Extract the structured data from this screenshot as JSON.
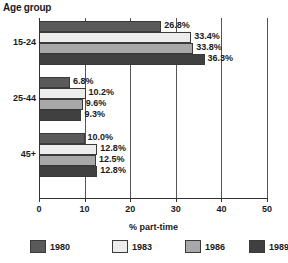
{
  "chart_data": {
    "type": "bar",
    "orientation": "horizontal",
    "title": "Age group",
    "xlabel": "% part-time",
    "ylabel": "Age group",
    "categories": [
      "15-24",
      "25-44",
      "45+"
    ],
    "series": [
      {
        "name": "1980",
        "color": "#5a5a5a",
        "values": [
          26.8,
          6.8,
          10.0
        ]
      },
      {
        "name": "1983",
        "color": "#ececec",
        "values": [
          33.4,
          10.2,
          12.8
        ]
      },
      {
        "name": "1986",
        "color": "#a8a8a8",
        "values": [
          33.8,
          9.6,
          12.5
        ]
      },
      {
        "name": "1989",
        "color": "#404040",
        "values": [
          36.3,
          9.3,
          12.8
        ]
      }
    ],
    "value_labels": [
      [
        "26.8%",
        "33.4%",
        "33.8%",
        "36.3%"
      ],
      [
        "6.8%",
        "10.2%",
        "9.6%",
        "9.3%"
      ],
      [
        "10.0%",
        "12.8%",
        "12.5%",
        "12.8%"
      ]
    ],
    "xlim": [
      0,
      50
    ],
    "xticks": [
      0,
      10,
      20,
      30,
      40,
      50
    ],
    "xtick_labels": [
      "0",
      "10",
      "20",
      "30",
      "40",
      "50"
    ],
    "grid": true,
    "legend_position": "bottom"
  },
  "legend": {
    "items": [
      {
        "label": "1980"
      },
      {
        "label": "1983"
      },
      {
        "label": "1986"
      },
      {
        "label": "1989"
      }
    ]
  }
}
